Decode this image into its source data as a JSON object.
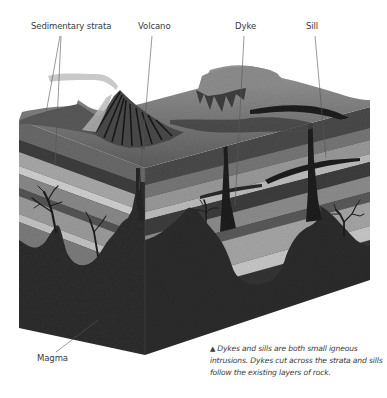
{
  "labels": {
    "sedimentary_strata": "Sedimentary strata",
    "volcano": "Volcano",
    "dyke": "Dyke",
    "sill": "Sill",
    "magma": "Magma"
  },
  "caption": {
    "marker": "▲",
    "text": "Dykes and sills are both small igneous intrusions. Dykes cut across the strata and sills follow the existing layers of rock."
  },
  "colors": {
    "background": "#ffffff",
    "label_text": "#3a3a3a",
    "leader_line": "#555555",
    "magma": "#2b2b2b",
    "strata_light": "#a8a8a8",
    "strata_mid": "#7a7a7a",
    "strata_dark": "#4a4a4a"
  }
}
